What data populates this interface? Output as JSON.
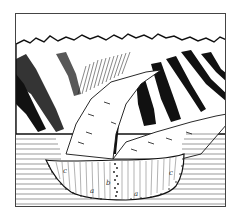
{
  "figure": {
    "labels": {
      "left_c": "c",
      "center_b": "b",
      "left_a": "a",
      "right_a": "a",
      "right_c": "c"
    },
    "colors": {
      "ink": "#111111",
      "paper": "#ffffff",
      "frame": "#444444"
    }
  }
}
